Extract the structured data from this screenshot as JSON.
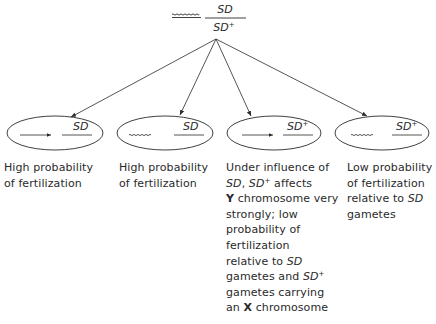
{
  "top": {
    "chromosome_symbol": "wavy-line",
    "genotype_numerator": "SD",
    "genotype_denominator": "SD",
    "genotype_denominator_sup": "+"
  },
  "gametes": [
    {
      "left_chromosome": "straight-arrow",
      "label": "SD",
      "label_sup": "",
      "caption_lines": [
        [
          {
            "text": "High probability"
          }
        ],
        [
          {
            "text": "of fertilization"
          }
        ]
      ]
    },
    {
      "left_chromosome": "wavy-line",
      "label": "SD",
      "label_sup": "",
      "caption_lines": [
        [
          {
            "text": "High probability"
          }
        ],
        [
          {
            "text": "of fertilization"
          }
        ]
      ]
    },
    {
      "left_chromosome": "straight-arrow",
      "label": "SD",
      "label_sup": "+",
      "caption_lines": [
        [
          {
            "text": "Under influence of"
          }
        ],
        [
          {
            "text": "SD",
            "style": "italic"
          },
          {
            "text": ", "
          },
          {
            "text": "SD",
            "style": "italic"
          },
          {
            "text": "+",
            "style": "sup"
          },
          {
            "text": " affects"
          }
        ],
        [
          {
            "text": "Y",
            "style": "bold"
          },
          {
            "text": " chromosome very"
          }
        ],
        [
          {
            "text": "strongly; low"
          }
        ],
        [
          {
            "text": "probability of"
          }
        ],
        [
          {
            "text": "fertilization"
          }
        ],
        [
          {
            "text": "relative to "
          },
          {
            "text": "SD",
            "style": "italic"
          }
        ],
        [
          {
            "text": "gametes and "
          },
          {
            "text": "SD",
            "style": "italic"
          },
          {
            "text": "+",
            "style": "sup"
          }
        ],
        [
          {
            "text": "gametes carrying"
          }
        ],
        [
          {
            "text": "an "
          },
          {
            "text": "X",
            "style": "bold"
          },
          {
            "text": " chromosome"
          }
        ]
      ]
    },
    {
      "left_chromosome": "wavy-line",
      "label": "SD",
      "label_sup": "+",
      "caption_lines": [
        [
          {
            "text": "Low probability"
          }
        ],
        [
          {
            "text": "of fertilization"
          }
        ],
        [
          {
            "text": "relative to "
          },
          {
            "text": "SD",
            "style": "italic"
          }
        ],
        [
          {
            "text": "gametes"
          }
        ]
      ]
    }
  ],
  "colors": {
    "ink": "#2a2a2a",
    "background": "#ffffff"
  }
}
